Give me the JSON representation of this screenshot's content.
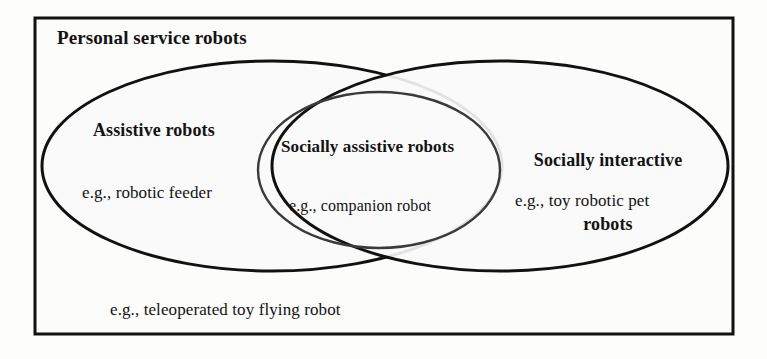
{
  "diagram": {
    "type": "venn",
    "kind": "three-region-overlapping-ellipses",
    "universe": {
      "label": "Personal service robots",
      "outside_example": "e.g., teleoperated toy flying robot"
    },
    "sets": [
      {
        "id": "assistive",
        "label": "Assistive robots",
        "example": "e.g., robotic feeder",
        "position": "left"
      },
      {
        "id": "socially-assistive",
        "label": "Socially assistive robots",
        "example": "e.g., companion robot",
        "position": "center-intersection"
      },
      {
        "id": "socially-interactive",
        "label_line1": "Socially interactive",
        "label_line2": "robots",
        "label": "Socially interactive robots",
        "example": "e.g., toy robotic pet",
        "position": "right"
      }
    ],
    "colors": {
      "stroke": "#111111",
      "fill": "#fbfbfa",
      "background": "#fdfdfc",
      "text": "#131313",
      "intersection_stroke": "#3a3a3a"
    }
  }
}
